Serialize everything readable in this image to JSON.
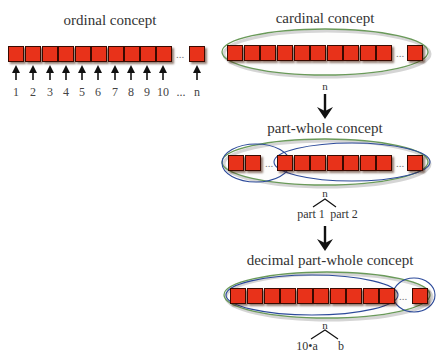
{
  "diagram": {
    "ordinal": {
      "title": "ordinal concept",
      "numbers": [
        "1",
        "2",
        "3",
        "4",
        "5",
        "6",
        "7",
        "8",
        "9",
        "10",
        "...",
        "n"
      ],
      "ellipsis": "..."
    },
    "cardinal": {
      "title": "cardinal concept",
      "ellipsis": "...",
      "total_label": "n"
    },
    "part_whole": {
      "title": "part-whole concept",
      "ellipsis_left": "...",
      "ellipsis_right": "...",
      "total_label": "n",
      "part1_label": "part 1",
      "part2_label": "part 2"
    },
    "decimal_part_whole": {
      "title": "decimal part-whole concept",
      "ellipsis": "...",
      "total_label": "n",
      "tens_label": "10•a",
      "ones_label": "b"
    },
    "colors": {
      "square_fill": "#e8321a",
      "square_border": "#3a0a00",
      "outer_ellipse": "#6a9a5a",
      "inner_ellipse": "#2c4a9a",
      "arrow": "#111111"
    }
  }
}
